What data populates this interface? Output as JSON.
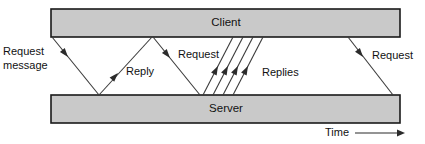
{
  "diagram": {
    "colors": {
      "bar_fill": "#c9c9c9",
      "bar_stroke": "#1a1a1a",
      "line": "#3b3b3b",
      "arrow": "#2b2b2b",
      "text": "#111111",
      "background": "#ffffff"
    },
    "lifelines": [
      {
        "id": "client",
        "label": "Client",
        "x": 51,
        "y": 9,
        "width": 349,
        "height": 28,
        "label_x": 226,
        "label_y": 23
      },
      {
        "id": "server",
        "label": "Server",
        "x": 51,
        "y": 95,
        "width": 349,
        "height": 28,
        "label_x": 226,
        "label_y": 109
      }
    ],
    "messages": [
      {
        "id": "request-1",
        "label": "Request",
        "label_line2": "message",
        "direction": "client-to-server",
        "from_x": 52,
        "from_y": 37,
        "to_x": 99,
        "to_y": 95,
        "label_x": 3,
        "label_y": 52,
        "label2_x": 3,
        "label2_y": 66,
        "arrow_x": 68,
        "arrow_y": 57,
        "anchor": "start"
      },
      {
        "id": "reply-1",
        "label": "Reply",
        "direction": "server-to-client",
        "from_x": 99,
        "from_y": 95,
        "to_x": 152,
        "to_y": 37,
        "label_x": 126,
        "label_y": 72,
        "arrow_x": 118,
        "arrow_y": 73,
        "anchor": "start"
      },
      {
        "id": "request-2",
        "label": "Request",
        "direction": "client-to-server",
        "from_x": 153,
        "from_y": 37,
        "to_x": 200,
        "to_y": 95,
        "label_x": 178,
        "label_y": 55,
        "arrow_x": 170,
        "arrow_y": 58,
        "anchor": "start"
      },
      {
        "id": "replies-group",
        "label": "Replies",
        "direction": "server-to-client",
        "count": 4,
        "label_x": 262,
        "label_y": 73,
        "lines": [
          {
            "from_x": 203,
            "from_y": 95,
            "to_x": 233,
            "to_y": 37,
            "arrow_x": 218,
            "arrow_y": 66
          },
          {
            "from_x": 213,
            "from_y": 95,
            "to_x": 243,
            "to_y": 37,
            "arrow_x": 228,
            "arrow_y": 66
          },
          {
            "from_x": 223,
            "from_y": 95,
            "to_x": 253,
            "to_y": 37,
            "arrow_x": 238,
            "arrow_y": 66
          },
          {
            "from_x": 233,
            "from_y": 95,
            "to_x": 263,
            "to_y": 37,
            "arrow_x": 248,
            "arrow_y": 66
          }
        ]
      },
      {
        "id": "request-3",
        "label": "Request",
        "direction": "client-to-server",
        "from_x": 348,
        "from_y": 37,
        "to_x": 393,
        "to_y": 95,
        "label_x": 372,
        "label_y": 56,
        "arrow_x": 363,
        "arrow_y": 57,
        "anchor": "start"
      }
    ],
    "time_axis": {
      "label": "Time",
      "label_x": 325,
      "label_y": 133,
      "line_from_x": 355,
      "line_to_x": 405,
      "line_y": 133
    }
  }
}
